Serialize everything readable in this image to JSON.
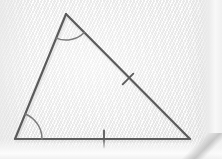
{
  "figure": {
    "kind": "geometry-diagram",
    "shape": "triangle",
    "media": "scanned textbook page",
    "canvas": {
      "width": 222,
      "height": 159
    },
    "colors": {
      "stroke": "#5a5a5a",
      "stroke_light": "#7b7b7b",
      "paper": "#f1f1f1",
      "paper_highlight": "#fafafa",
      "paper_shadow": "#e2e2e2"
    },
    "stroke_width": 2.1,
    "vertices": [
      {
        "id": "apex",
        "label": "",
        "x": 66,
        "y": 14
      },
      {
        "id": "bottom-left",
        "label": "",
        "x": 15,
        "y": 139
      },
      {
        "id": "bottom-right",
        "label": "",
        "x": 190,
        "y": 139
      }
    ],
    "sides": [
      {
        "id": "left-side",
        "from": "bottom-left",
        "to": "apex",
        "ticks": 0
      },
      {
        "id": "hypotenuse",
        "from": "apex",
        "to": "bottom-right",
        "ticks": 1
      },
      {
        "id": "base",
        "from": "bottom-left",
        "to": "bottom-right",
        "ticks": 1
      }
    ],
    "angle_arcs": [
      {
        "id": "apex-angle-arc",
        "at": "apex",
        "radius": 26,
        "marks": 1
      },
      {
        "id": "bottom-left-angle-arc",
        "at": "bottom-left",
        "radius": 27,
        "marks": 1
      }
    ],
    "tick_marks": [
      {
        "id": "hypotenuse-tick",
        "on": "hypotenuse",
        "x": 128,
        "y": 79,
        "length": 15
      },
      {
        "id": "base-tick",
        "on": "base",
        "x": 104,
        "y": 139,
        "length": 17
      }
    ],
    "labels": []
  }
}
